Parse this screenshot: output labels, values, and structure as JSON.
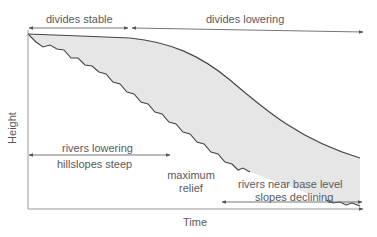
{
  "diagram": {
    "type": "landscape-evolution",
    "axes": {
      "x_label": "Time",
      "y_label": "Height"
    },
    "phases_top": [
      {
        "label": "divides stable"
      },
      {
        "label": "divides lowering"
      }
    ],
    "phases_bottom": [
      {
        "label_line1": "rivers lowering",
        "label_line2": "hillslopes steep"
      },
      {
        "label_line1": "rivers near base level",
        "label_line2": "slopes declining"
      }
    ],
    "annotation": {
      "label_line1": "maximum",
      "label_line2": "relief"
    },
    "curves": [
      {
        "name": "divide-height",
        "description": "upper smooth curve"
      },
      {
        "name": "river-height",
        "description": "lower stepped curve"
      }
    ],
    "colors": {
      "fill": "#e6e6e6",
      "line": "#444444",
      "axis": "#888888",
      "text": "#5a5a5a"
    }
  }
}
